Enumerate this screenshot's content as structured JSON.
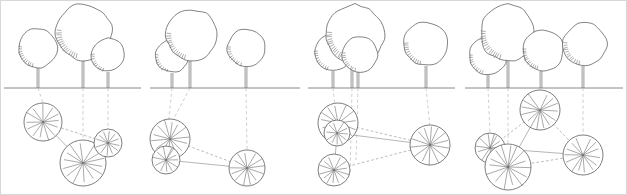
{
  "figure": {
    "panel_count": 4,
    "width": 627,
    "height": 195,
    "ground_line_y": 88,
    "colors": {
      "background": "#ffffff",
      "outline": "#5a5a5a",
      "ground": "#7a7a7a",
      "projection": "#b9b9c4",
      "network": "#8b8b94",
      "frame": "#d8d8d8"
    }
  },
  "panels": [
    {
      "id": "panel-1",
      "label": "Stage 1",
      "x_offset": 0,
      "width": 147,
      "ground_span": [
        4,
        141
      ],
      "trees": [
        {
          "name": "tree-a",
          "cx": 38,
          "cy": 48,
          "r": 20,
          "trunk_x": 38,
          "trunk_top": 68,
          "hatch_side": "left"
        },
        {
          "name": "tree-b",
          "cx": 84,
          "cy": 32,
          "r": 28,
          "trunk_x": 83,
          "trunk_top": 60,
          "hatch_side": "left"
        },
        {
          "name": "tree-c",
          "cx": 108,
          "cy": 55,
          "r": 17,
          "trunk_x": 108,
          "trunk_top": 72,
          "hatch_side": "left"
        }
      ],
      "roots": [
        {
          "name": "root-a",
          "cx": 43,
          "cy": 122,
          "r": 19,
          "spokes": 13
        },
        {
          "name": "root-b",
          "cx": 83,
          "cy": 163,
          "r": 23,
          "spokes": 14
        },
        {
          "name": "root-c",
          "cx": 108,
          "cy": 143,
          "r": 14,
          "spokes": 12
        }
      ],
      "projections": [
        {
          "from": [
            38,
            88
          ],
          "to": [
            43,
            103
          ]
        },
        {
          "from": [
            83,
            88
          ],
          "to": [
            83,
            140
          ]
        },
        {
          "from": [
            108,
            88
          ],
          "to": [
            108,
            129
          ]
        }
      ],
      "network": [
        {
          "from": "root-a",
          "to": "root-c"
        },
        {
          "from": "root-a",
          "to": "root-b"
        },
        {
          "from": "root-b",
          "to": "root-c"
        }
      ]
    },
    {
      "id": "panel-2",
      "label": "Stage 2",
      "x_offset": 147,
      "width": 157,
      "ground_span": [
        150,
        300
      ],
      "trees": [
        {
          "name": "tree-a",
          "cx": 172,
          "cy": 56,
          "r": 17,
          "trunk_x": 172,
          "trunk_top": 73,
          "hatch_side": "left"
        },
        {
          "name": "tree-b",
          "cx": 192,
          "cy": 35,
          "r": 26,
          "trunk_x": 190,
          "trunk_top": 61,
          "hatch_side": "left"
        },
        {
          "name": "tree-c",
          "cx": 246,
          "cy": 48,
          "r": 19,
          "trunk_x": 246,
          "trunk_top": 67,
          "hatch_side": "left"
        }
      ],
      "roots": [
        {
          "name": "root-a",
          "cx": 170,
          "cy": 139,
          "r": 20,
          "spokes": 14
        },
        {
          "name": "root-b",
          "cx": 170,
          "cy": 160,
          "r": 0,
          "spokes": 0
        },
        {
          "name": "root-c",
          "cx": 247,
          "cy": 168,
          "r": 18,
          "spokes": 13
        },
        {
          "name": "root-d",
          "cx": 166,
          "cy": 160,
          "r": 14,
          "spokes": 12
        }
      ],
      "projections": [
        {
          "from": [
            172,
            88
          ],
          "to": [
            166,
            146
          ]
        },
        {
          "from": [
            190,
            88
          ],
          "to": [
            172,
            122
          ]
        },
        {
          "from": [
            246,
            88
          ],
          "to": [
            247,
            150
          ]
        }
      ],
      "network": [
        {
          "from": "root-a",
          "to": "root-c"
        },
        {
          "from": "root-d",
          "to": "root-c"
        }
      ]
    },
    {
      "id": "panel-3",
      "label": "Stage 3",
      "x_offset": 304,
      "width": 157,
      "ground_span": [
        308,
        455
      ],
      "trees": [
        {
          "name": "tree-a",
          "cx": 333,
          "cy": 52,
          "r": 19,
          "trunk_x": 333,
          "trunk_top": 71,
          "hatch_side": "left"
        },
        {
          "name": "tree-b",
          "cx": 355,
          "cy": 34,
          "r": 29,
          "trunk_x": 352,
          "trunk_top": 63,
          "hatch_side": "left"
        },
        {
          "name": "tree-c",
          "cx": 360,
          "cy": 54,
          "r": 18,
          "trunk_x": 358,
          "trunk_top": 72,
          "hatch_side": "left"
        },
        {
          "name": "tree-d",
          "cx": 426,
          "cy": 44,
          "r": 22,
          "trunk_x": 426,
          "trunk_top": 66,
          "hatch_side": "left"
        }
      ],
      "roots": [
        {
          "name": "root-a",
          "cx": 338,
          "cy": 123,
          "r": 20,
          "spokes": 14
        },
        {
          "name": "root-b",
          "cx": 335,
          "cy": 134,
          "r": 0,
          "spokes": 0
        },
        {
          "name": "root-c",
          "cx": 334,
          "cy": 170,
          "r": 16,
          "spokes": 13
        },
        {
          "name": "root-d",
          "cx": 430,
          "cy": 145,
          "r": 20,
          "spokes": 14
        },
        {
          "name": "root-e",
          "cx": 337,
          "cy": 133,
          "r": 13,
          "spokes": 11
        }
      ],
      "projections": [
        {
          "from": [
            333,
            88
          ],
          "to": [
            337,
            124
          ]
        },
        {
          "from": [
            352,
            88
          ],
          "to": [
            350,
            175
          ]
        },
        {
          "from": [
            358,
            88
          ],
          "to": [
            356,
            160
          ]
        },
        {
          "from": [
            426,
            88
          ],
          "to": [
            430,
            127
          ]
        }
      ],
      "network": [
        {
          "from": "root-a",
          "to": "root-d"
        },
        {
          "from": "root-e",
          "to": "root-d"
        },
        {
          "from": "root-c",
          "to": "root-d"
        },
        {
          "from": "root-a",
          "to": "root-c"
        },
        {
          "from": "root-a",
          "to": "root-e"
        }
      ]
    },
    {
      "id": "panel-4",
      "label": "Stage 4",
      "x_offset": 461,
      "width": 166,
      "ground_span": [
        465,
        623
      ],
      "trees": [
        {
          "name": "tree-a",
          "cx": 488,
          "cy": 56,
          "r": 19,
          "trunk_x": 488,
          "trunk_top": 75,
          "hatch_side": "left"
        },
        {
          "name": "tree-b",
          "cx": 508,
          "cy": 33,
          "r": 28,
          "trunk_x": 508,
          "trunk_top": 61,
          "hatch_side": "left"
        },
        {
          "name": "tree-c",
          "cx": 543,
          "cy": 50,
          "r": 21,
          "trunk_x": 541,
          "trunk_top": 71,
          "hatch_side": "left"
        },
        {
          "name": "tree-d",
          "cx": 585,
          "cy": 44,
          "r": 22,
          "trunk_x": 583,
          "trunk_top": 66,
          "hatch_side": "left"
        }
      ],
      "roots": [
        {
          "name": "root-a",
          "cx": 490,
          "cy": 148,
          "r": 15,
          "spokes": 12
        },
        {
          "name": "root-b",
          "cx": 508,
          "cy": 167,
          "r": 23,
          "spokes": 15
        },
        {
          "name": "root-c",
          "cx": 540,
          "cy": 110,
          "r": 20,
          "spokes": 14
        },
        {
          "name": "root-d",
          "cx": 583,
          "cy": 155,
          "r": 20,
          "spokes": 14
        }
      ],
      "projections": [
        {
          "from": [
            488,
            88
          ],
          "to": [
            490,
            133
          ]
        },
        {
          "from": [
            508,
            88
          ],
          "to": [
            508,
            144
          ]
        },
        {
          "from": [
            541,
            88
          ],
          "to": [
            540,
            90
          ]
        },
        {
          "from": [
            583,
            88
          ],
          "to": [
            583,
            135
          ]
        }
      ],
      "network": [
        {
          "from": "root-c",
          "to": "root-a"
        },
        {
          "from": "root-c",
          "to": "root-b"
        },
        {
          "from": "root-c",
          "to": "root-d"
        },
        {
          "from": "root-a",
          "to": "root-b"
        },
        {
          "from": "root-b",
          "to": "root-d"
        },
        {
          "from": "root-a",
          "to": "root-d"
        }
      ]
    }
  ]
}
